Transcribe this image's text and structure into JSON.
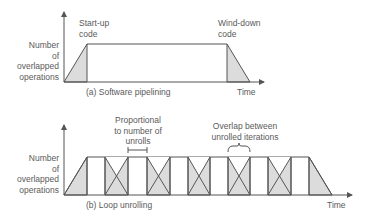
{
  "panels": [
    {
      "id": "a",
      "caption": "(a) Software pipelining",
      "ylabel_lines": [
        "Number",
        "of",
        "overlapped",
        "operations"
      ],
      "xlabel": "Time",
      "annotations": [
        {
          "lines": [
            "Start-up",
            "code"
          ]
        },
        {
          "lines": [
            "Wind-down",
            "code"
          ]
        }
      ]
    },
    {
      "id": "b",
      "caption": "(b) Loop unrolling",
      "ylabel_lines": [
        "Number",
        "of",
        "overlapped",
        "operations"
      ],
      "xlabel": "Time",
      "annotations": [
        {
          "lines": [
            "Proportional",
            "to number of",
            "unrolls"
          ]
        },
        {
          "lines": [
            "Overlap between",
            "unrolled iterations"
          ]
        }
      ]
    }
  ],
  "colors": {
    "line": "#555555",
    "fill": "#dcdcdc",
    "text": "#5a5a5a"
  }
}
